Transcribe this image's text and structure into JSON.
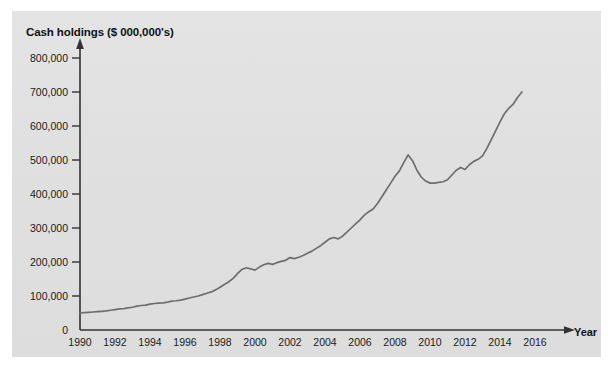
{
  "figure": {
    "background_color": "#ffffff",
    "panel_color": "#e2e2e2",
    "line_color": "#6e6e6e",
    "axis_color": "#333333"
  },
  "axes": {
    "y_title": "Cash holdings ($ 000,000's)",
    "x_title": "Year",
    "y_ticks": [
      "800,000",
      "700,000",
      "600,000",
      "500,000",
      "400,000",
      "300,000",
      "200,000",
      "100,000",
      "0"
    ],
    "x_ticks": [
      "1990",
      "1992",
      "1994",
      "1996",
      "1998",
      "2000",
      "2002",
      "2004",
      "2006",
      "2008",
      "2010",
      "2012",
      "2014",
      "2016"
    ]
  },
  "chart_data": {
    "type": "line",
    "title": "",
    "xlabel": "Year",
    "ylabel": "Cash holdings ($ 000,000's)",
    "xlim": [
      1990,
      2016.6
    ],
    "ylim": [
      0,
      830000
    ],
    "grid": false,
    "legend": null,
    "y_tick_values": [
      0,
      100000,
      200000,
      300000,
      400000,
      500000,
      600000,
      700000,
      800000
    ],
    "x_tick_values": [
      1990,
      1992,
      1994,
      1996,
      1998,
      2000,
      2002,
      2004,
      2006,
      2008,
      2010,
      2012,
      2014,
      2016
    ],
    "series": [
      {
        "name": "Cash holdings",
        "x": [
          1990.0,
          1990.25,
          1990.5,
          1990.75,
          1991.0,
          1991.25,
          1991.5,
          1991.75,
          1992.0,
          1992.25,
          1992.5,
          1992.75,
          1993.0,
          1993.25,
          1993.5,
          1993.75,
          1994.0,
          1994.25,
          1994.5,
          1994.75,
          1995.0,
          1995.25,
          1995.5,
          1995.75,
          1996.0,
          1996.25,
          1996.5,
          1996.75,
          1997.0,
          1997.25,
          1997.5,
          1997.75,
          1998.0,
          1998.25,
          1998.5,
          1998.75,
          1999.0,
          1999.25,
          1999.5,
          1999.75,
          2000.0,
          2000.25,
          2000.5,
          2000.75,
          2001.0,
          2001.25,
          2001.5,
          2001.75,
          2002.0,
          2002.25,
          2002.5,
          2002.75,
          2003.0,
          2003.25,
          2003.5,
          2003.75,
          2004.0,
          2004.25,
          2004.5,
          2004.75,
          2005.0,
          2005.25,
          2005.5,
          2005.75,
          2006.0,
          2006.25,
          2006.5,
          2006.75,
          2007.0,
          2007.25,
          2007.5,
          2007.75,
          2008.0,
          2008.25,
          2008.5,
          2008.75,
          2009.0,
          2009.25,
          2009.5,
          2009.75,
          2010.0,
          2010.25,
          2010.5,
          2010.75,
          2011.0,
          2011.25,
          2011.5,
          2011.75,
          2012.0,
          2012.25,
          2012.5,
          2012.75,
          2013.0,
          2013.25,
          2013.5,
          2013.75,
          2014.0,
          2014.25,
          2014.5,
          2014.75,
          2015.0,
          2015.25
        ],
        "y": [
          50000,
          51000,
          52000,
          53000,
          54000,
          55000,
          56000,
          58000,
          60000,
          62000,
          63000,
          65000,
          67000,
          70000,
          72000,
          73000,
          76000,
          78000,
          79000,
          80000,
          82000,
          85000,
          86000,
          88000,
          91000,
          94000,
          97000,
          100000,
          104000,
          108000,
          112000,
          118000,
          126000,
          134000,
          142000,
          152000,
          166000,
          178000,
          183000,
          180000,
          176000,
          185000,
          192000,
          196000,
          193000,
          198000,
          202000,
          205000,
          213000,
          210000,
          214000,
          219000,
          226000,
          232000,
          240000,
          248000,
          258000,
          268000,
          272000,
          268000,
          276000,
          288000,
          300000,
          312000,
          324000,
          338000,
          348000,
          356000,
          372000,
          392000,
          412000,
          432000,
          452000,
          468000,
          492000,
          515000,
          498000,
          470000,
          450000,
          438000,
          432000,
          432000,
          434000,
          436000,
          442000,
          456000,
          470000,
          478000,
          472000,
          486000,
          496000,
          502000,
          512000,
          534000,
          560000,
          586000,
          612000,
          636000,
          652000,
          664000,
          684000,
          700000
        ]
      }
    ]
  }
}
